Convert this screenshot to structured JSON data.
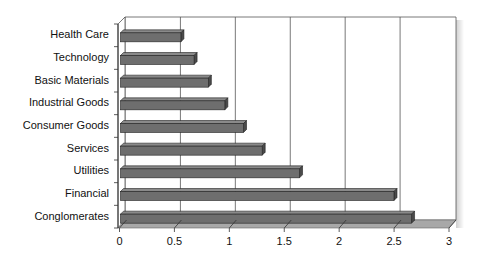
{
  "chart_data": {
    "type": "bar",
    "orientation": "horizontal",
    "style": "3d",
    "title": "",
    "xlabel": "",
    "ylabel": "",
    "categories": [
      "Health Care",
      "Technology",
      "Basic Materials",
      "Industrial Goods",
      "Consumer Goods",
      "Services",
      "Utilities",
      "Financial",
      "Conglomerates"
    ],
    "values": [
      0.55,
      0.67,
      0.8,
      0.95,
      1.12,
      1.29,
      1.63,
      2.49,
      2.65
    ],
    "xlim": [
      0,
      3
    ],
    "x_ticks": [
      "0",
      "0.5",
      "1",
      "1.5",
      "2",
      "2.5",
      "3"
    ],
    "grid": "vertical",
    "legend": "none",
    "bar_color": "#6e6e6e",
    "floor_color": "#a8a8a8"
  }
}
